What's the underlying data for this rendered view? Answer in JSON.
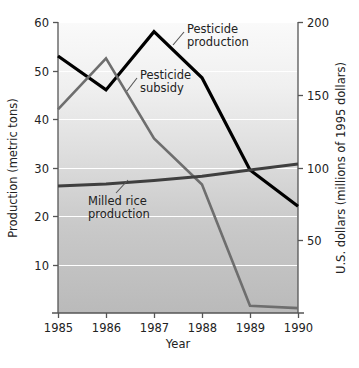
{
  "chart_data": {
    "type": "line",
    "title": "",
    "xlabel": "Year",
    "ylabel": "Production (metric tons)",
    "y2label": "U.S. dollars (millions of 1995 dollars)",
    "x": [
      1985,
      1986,
      1987,
      1988,
      1989,
      1990
    ],
    "xticklabels": [
      "1985",
      "1986",
      "1987",
      "1988",
      "1989",
      "1990"
    ],
    "xlim": [
      1985,
      1990
    ],
    "ylim": [
      0,
      60
    ],
    "yticks": [
      10,
      20,
      30,
      40,
      50,
      60
    ],
    "yticklabels": [
      "10",
      "20",
      "30",
      "40",
      "50",
      "60"
    ],
    "y2lim": [
      0,
      200
    ],
    "y2ticks": [
      50,
      100,
      150,
      200
    ],
    "y2ticklabels": [
      "50",
      "100",
      "150",
      "200"
    ],
    "grid": "horizontal-white-gridlines",
    "legend": "inline-annotations",
    "series": [
      {
        "name": "Pesticide production",
        "axis": "left",
        "color": "#000000",
        "width": 3.2,
        "values": [
          53,
          46,
          58,
          48.5,
          29.5,
          22
        ]
      },
      {
        "name": "Pesticide subsidy",
        "axis": "right",
        "color": "#6e6e6e",
        "width": 2.6,
        "values_right_axis": [
          140,
          175,
          120,
          88,
          5,
          3
        ],
        "values": [
          42,
          52.5,
          36,
          26.5,
          1.5,
          1
        ]
      },
      {
        "name": "Milled rice production",
        "axis": "left",
        "color": "#3f3f3f",
        "width": 3.0,
        "values": [
          26.2,
          26.6,
          27.3,
          28.2,
          29.5,
          30.7
        ]
      }
    ],
    "annotations": [
      {
        "name": "pesticide-production",
        "lines": [
          "Pesticide",
          "production"
        ]
      },
      {
        "name": "pesticide-subsidy",
        "lines": [
          "Pesticide",
          "subsidy"
        ]
      },
      {
        "name": "milled-rice-production",
        "lines": [
          "Milled rice",
          "production"
        ]
      }
    ],
    "colors": {
      "plot_background_top": "#f7f7f7",
      "plot_background_bottom": "#bcbcbc",
      "gridline": "#ffffff",
      "axis": "#555555"
    }
  }
}
